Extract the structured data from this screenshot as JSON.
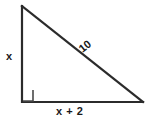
{
  "figure": {
    "type": "right-triangle-diagram",
    "colors": {
      "stroke": "#2b2b2b",
      "label": "#1a1a1a",
      "background": "#ffffff"
    },
    "labels": {
      "vertical_leg": "x",
      "horizontal_leg": "x + 2",
      "hypotenuse": "10"
    },
    "right_angle_marker": {
      "present": true,
      "vertex": "bottom-left"
    },
    "vertices": {
      "top": [
        22,
        6
      ],
      "bottom_left": [
        22,
        102
      ],
      "bottom_right": [
        143,
        102
      ]
    }
  }
}
